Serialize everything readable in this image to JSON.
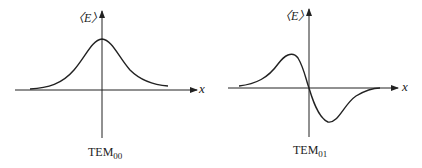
{
  "figure": {
    "panels": [
      {
        "id": "tem00",
        "y_axis_label": "〈E〉",
        "x_axis_label": "x",
        "mode_prefix": "TEM",
        "mode_index": "00",
        "curve": "Gaussian profile, single positive peak centered on x = 0"
      },
      {
        "id": "tem01",
        "y_axis_label": "〈E〉",
        "x_axis_label": "x",
        "mode_prefix": "TEM",
        "mode_index": "01",
        "curve": "Antisymmetric profile: positive peak for x < 0, zero crossing at x = 0, negative trough for x > 0"
      }
    ],
    "colors": {
      "line": "#222222",
      "background": "#ffffff"
    }
  }
}
